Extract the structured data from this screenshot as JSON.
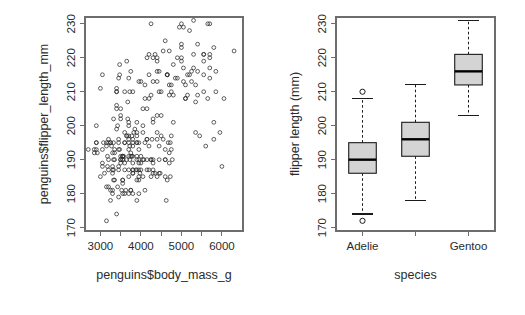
{
  "figure": {
    "background": "#ffffff",
    "width": 525,
    "height": 315,
    "panels": 2
  },
  "chart_data": [
    {
      "type": "scatter",
      "panel": "left",
      "title": "",
      "xlabel": "penguins$body_mass_g",
      "ylabel": "penguins$flipper_length_mm",
      "xlim": [
        2620,
        6520
      ],
      "ylim": [
        169,
        232
      ],
      "grid": false,
      "legend": "none",
      "xticks": [
        3000,
        3500,
        4000,
        4500,
        5000,
        5500,
        6000
      ],
      "xtick_labels": [
        "3000",
        "",
        "4000",
        "",
        "5000",
        "",
        "6000"
      ],
      "yticks": [
        170,
        180,
        190,
        200,
        210,
        220,
        230
      ],
      "ytick_labels": [
        "170",
        "180",
        "190",
        "200",
        "210",
        "220",
        "230"
      ],
      "point_marker": "open-circle",
      "point_color": "#2b2b2b",
      "x": [
        3750,
        3800,
        3250,
        3450,
        3650,
        3625,
        4675,
        3475,
        4250,
        3300,
        3700,
        3200,
        3800,
        4400,
        3700,
        3450,
        4500,
        3325,
        4200,
        3400,
        3600,
        3800,
        3950,
        3800,
        3800,
        3550,
        3200,
        3150,
        3950,
        3250,
        3900,
        3300,
        3900,
        3325,
        4150,
        3950,
        3550,
        3300,
        4650,
        3150,
        3900,
        3100,
        4400,
        3000,
        4600,
        3425,
        3450,
        4150,
        3500,
        4300,
        3450,
        4050,
        2900,
        3700,
        3550,
        3800,
        2850,
        3750,
        3150,
        4400,
        3600,
        4050,
        2850,
        3950,
        3350,
        4100,
        3050,
        4450,
        3600,
        3900,
        3550,
        4150,
        3700,
        4250,
        3700,
        3900,
        3550,
        4000,
        3200,
        4700,
        3800,
        4200,
        3350,
        3550,
        3800,
        3500,
        3950,
        3600,
        3550,
        4300,
        3400,
        4450,
        3300,
        4300,
        3700,
        4350,
        2900,
        4100,
        3725,
        4725,
        3075,
        4250,
        2925,
        3550,
        3750,
        3900,
        3175,
        4775,
        3825,
        4600,
        3200,
        4275,
        3900,
        4075,
        2900,
        3775,
        3350,
        3325,
        3150,
        3500,
        3450,
        3875,
        3050,
        4000,
        3275,
        4300,
        3050,
        4000,
        3325,
        3500,
        3500,
        4475,
        3425,
        3900,
        3175,
        3975,
        3400,
        4250,
        3400,
        3475,
        3050,
        3725,
        3000,
        3650,
        4250,
        3475,
        3450,
        3750,
        3700,
        4000,
        4500,
        5700,
        4450,
        5700,
        5400,
        4550,
        4800,
        5200,
        4400,
        5150,
        4650,
        5550,
        4650,
        5850,
        4200,
        5850,
        4150,
        6300,
        4800,
        5350,
        5700,
        5000,
        4400,
        5050,
        5000,
        5100,
        4100,
        5650,
        4600,
        5550,
        5250,
        4700,
        5050,
        6050,
        5150,
        5400,
        4950,
        5250,
        4350,
        5350,
        3950,
        5700,
        4300,
        4750,
        5550,
        4900,
        4200,
        5400,
        5100,
        5300,
        4850,
        5300,
        4400,
        5000,
        4900,
        5050,
        4300,
        5000,
        4450,
        5550,
        4200,
        5300,
        4400,
        5650,
        4700,
        5700,
        4650,
        5800,
        4700,
        5550,
        4750,
        5000,
        5100,
        5200,
        4700,
        5800,
        4600,
        6000,
        4750,
        5950,
        4625,
        5450,
        4725,
        5350,
        4750,
        5600,
        4600,
        5800,
        3500,
        3900,
        3650,
        3525,
        3725,
        3950,
        3250,
        3750,
        4150,
        3700,
        3800,
        3775,
        3700,
        4050,
        3575,
        4050,
        3300,
        3700,
        3450,
        4400,
        3600,
        3400,
        2900,
        3800,
        3300,
        4150,
        3400,
        3800,
        3700,
        4550,
        3200,
        4300,
        3350,
        4100,
        3600,
        3900,
        3850,
        4800,
        2700,
        4500,
        3950,
        3650,
        3550,
        3500,
        3675,
        4450,
        3400,
        4300,
        3250,
        3675,
        3325,
        3950,
        3600,
        4050,
        3350,
        3450,
        3250,
        4050,
        3800,
        3525,
        3950,
        3650,
        3650,
        4000,
        3400,
        3775,
        4100,
        3775
      ],
      "y": [
        181,
        186,
        195,
        193,
        190,
        181,
        195,
        193,
        190,
        186,
        180,
        182,
        191,
        198,
        185,
        195,
        197,
        184,
        194,
        174,
        180,
        189,
        185,
        180,
        187,
        183,
        187,
        172,
        180,
        178,
        178,
        188,
        184,
        195,
        196,
        190,
        180,
        181,
        184,
        182,
        195,
        186,
        196,
        185,
        190,
        182,
        179,
        190,
        191,
        186,
        188,
        190,
        200,
        187,
        191,
        186,
        193,
        181,
        194,
        185,
        195,
        185,
        192,
        184,
        192,
        195,
        188,
        190,
        198,
        190,
        190,
        196,
        197,
        190,
        195,
        191,
        184,
        187,
        195,
        189,
        196,
        187,
        193,
        191,
        194,
        190,
        189,
        189,
        190,
        202,
        205,
        186,
        180,
        187,
        191,
        186,
        193,
        181,
        194,
        185,
        195,
        185,
        192,
        184,
        192,
        195,
        188,
        190,
        198,
        190,
        190,
        196,
        197,
        190,
        195,
        191,
        184,
        187,
        195,
        189,
        196,
        187,
        193,
        191,
        194,
        190,
        189,
        189,
        190,
        202,
        205,
        186,
        200,
        187,
        191,
        186,
        211,
        230,
        210,
        218,
        215,
        210,
        211,
        219,
        209,
        215,
        214,
        216,
        214,
        213,
        210,
        217,
        210,
        221,
        209,
        222,
        218,
        215,
        213,
        215,
        215,
        215,
        215,
        216,
        215,
        210,
        220,
        222,
        209,
        207,
        230,
        220,
        220,
        213,
        219,
        208,
        208,
        208,
        225,
        210,
        216,
        222,
        217,
        208,
        209,
        216,
        229,
        213,
        221,
        212,
        213,
        214,
        213,
        210,
        219,
        220,
        208,
        224,
        208,
        221,
        214,
        231,
        219,
        230,
        214,
        229,
        220,
        223,
        216,
        221,
        221,
        217,
        216,
        230,
        209,
        220,
        215,
        223,
        212,
        221,
        212,
        224,
        212,
        228,
        192,
        196,
        193,
        188,
        197,
        198,
        178,
        197,
        195,
        198,
        193,
        194,
        185,
        201,
        190,
        201,
        197,
        181,
        190,
        195,
        181,
        191,
        187,
        193,
        195,
        197,
        200,
        200,
        191,
        205,
        187,
        201,
        187,
        203,
        195,
        199,
        195,
        210,
        192,
        205,
        210,
        187,
        196,
        196,
        196,
        201,
        190,
        212,
        187,
        198,
        199,
        201,
        193,
        203,
        187,
        197,
        191,
        203,
        202,
        194,
        206,
        189,
        195,
        207,
        202,
        193,
        210,
        198
      ]
    },
    {
      "type": "boxplot",
      "panel": "right",
      "title": "",
      "xlabel": "species",
      "ylabel": "flipper length (mm)",
      "ylim": [
        169,
        232
      ],
      "grid": false,
      "legend": "none",
      "yticks": [
        170,
        180,
        190,
        200,
        210,
        220,
        230
      ],
      "ytick_labels": [
        "170",
        "180",
        "190",
        "200",
        "210",
        "220",
        "230"
      ],
      "categories": [
        "Adelie",
        "",
        "Gentoo"
      ],
      "xtick_labels": [
        "Adelie",
        "",
        "Gentoo"
      ],
      "box_fill": "#d4d4d4",
      "box_stroke": "#1a1a1a",
      "boxes": [
        {
          "name": "Adelie",
          "lower_whisker": 174,
          "q1": 186,
          "median": 190,
          "q3": 195,
          "upper_whisker": 208,
          "outliers": [
            172,
            210
          ]
        },
        {
          "name": "Chinstrap",
          "lower_whisker": 178,
          "q1": 191,
          "median": 196,
          "q3": 201,
          "upper_whisker": 212,
          "outliers": []
        },
        {
          "name": "Gentoo",
          "lower_whisker": 203,
          "q1": 212,
          "median": 216,
          "q3": 221,
          "upper_whisker": 231,
          "outliers": []
        }
      ]
    }
  ]
}
